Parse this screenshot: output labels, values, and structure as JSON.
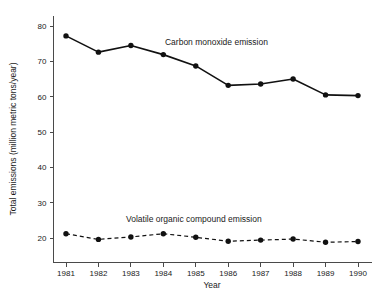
{
  "chart_data": {
    "type": "line",
    "title": "",
    "xlabel": "Year",
    "ylabel": "Total emissions (million metric tons/year)",
    "categories": [
      "1981",
      "1982",
      "1983",
      "1984",
      "1985",
      "1986",
      "1987",
      "1988",
      "1989",
      "1990"
    ],
    "x": [
      1981,
      1982,
      1983,
      1984,
      1985,
      1986,
      1987,
      1988,
      1989,
      1990
    ],
    "xlim": [
      1981,
      1990
    ],
    "ylim": [
      14,
      82
    ],
    "y_ticks": [
      20,
      30,
      40,
      50,
      60,
      70,
      80
    ],
    "y_tick_labels": [
      "20",
      "30",
      "40",
      "50",
      "60",
      "70",
      "80"
    ],
    "grid": false,
    "legend_position": "inline-annotation",
    "series": [
      {
        "name": "Carbon monoxide emission",
        "style": "solid",
        "marker": "filled-circle",
        "color": "#111111",
        "values": [
          77.2,
          72.6,
          74.5,
          71.9,
          68.7,
          63.2,
          63.6,
          65.0,
          60.5,
          60.3
        ],
        "label_x": 1984.05,
        "label_y": 74.6
      },
      {
        "name": "Volatile organic compound emission",
        "style": "dashed",
        "marker": "filled-circle",
        "color": "#111111",
        "values": [
          21.2,
          19.6,
          20.3,
          21.2,
          20.2,
          19.1,
          19.4,
          19.7,
          18.8,
          19.0
        ],
        "label_x": 1982.85,
        "label_y": 24.6
      }
    ]
  },
  "axes": {
    "y_title": "Total emissions (million metric tons/year)",
    "x_title": "Year",
    "y_tick_labels": [
      "80",
      "70",
      "60",
      "50",
      "40",
      "30",
      "20"
    ],
    "x_tick_labels": [
      "1981",
      "1982",
      "1983",
      "1984",
      "1985",
      "1986",
      "1987",
      "1988",
      "1989",
      "1990"
    ]
  },
  "annotations": {
    "series_one_label": "Carbon monoxide emission",
    "series_two_label": "Volatile organic compound emission"
  },
  "colors": {
    "line": "#111111",
    "axis": "#4a4a4a",
    "text": "#1a1a1a",
    "background": "#ffffff"
  }
}
